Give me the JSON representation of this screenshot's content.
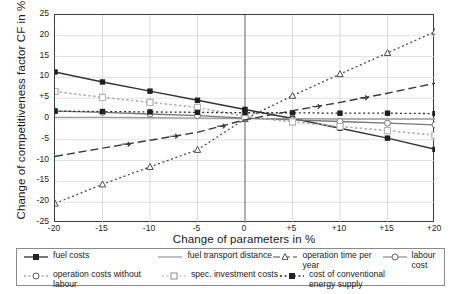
{
  "chart_data": {
    "type": "line",
    "title": "",
    "xlabel": "Change of parameters in %",
    "ylabel": "Change of competitiveness factor CF in %",
    "x": [
      -20,
      -15,
      -10,
      -5,
      0,
      5,
      10,
      15,
      20
    ],
    "xticklabels": [
      "-20",
      "-15",
      "-10",
      "-5",
      "0",
      "+5",
      "+10",
      "+15",
      "+20"
    ],
    "yticklabels": [
      "25",
      "20",
      "15",
      "10",
      "+5",
      "0",
      "-5",
      "-10",
      "-15",
      "-20",
      "-25"
    ],
    "yticks": [
      25,
      20,
      15,
      10,
      5,
      0,
      -5,
      -10,
      -15,
      -20,
      -25
    ],
    "xlim": [
      -20,
      20
    ],
    "ylim": [
      -25,
      25
    ],
    "grid": true,
    "legend_position": "below",
    "series": [
      {
        "name": "fuel costs",
        "color": "#333333",
        "dash": "solid",
        "marker": "filled-square",
        "values": [
          11.3,
          8.9,
          6.7,
          4.5,
          2.3,
          0.1,
          -2.2,
          -4.6,
          -7.3
        ]
      },
      {
        "name": "fuel transport distance",
        "color": "#9a9a9a",
        "dash": "solid",
        "marker": "none",
        "values": [
          0.4,
          0.4,
          0.3,
          0.2,
          0.1,
          0.1,
          0.0,
          0.0,
          0.0
        ]
      },
      {
        "name": "operation time per year",
        "color": "#4a4a4a",
        "dash": "dotted",
        "marker": "open-triangle",
        "values": [
          -20.3,
          -15.7,
          -11.5,
          -7.4,
          0.0,
          5.6,
          10.8,
          15.9,
          21.0
        ]
      },
      {
        "name": "labour cost",
        "color": "#777777",
        "dash": "solid",
        "marker": "open-circle",
        "values": [
          1.9,
          1.6,
          1.2,
          0.8,
          0.2,
          -0.2,
          -0.6,
          -1.0,
          -1.4
        ]
      },
      {
        "name": "operation costs without labour",
        "color": "#9e9e9e",
        "dash": "dashdot",
        "marker": "open-square",
        "values": [
          6.6,
          5.2,
          4.0,
          2.8,
          0.6,
          -0.7,
          -1.8,
          -2.8,
          -3.9
        ]
      },
      {
        "name": "spec. investment costs",
        "color": "#b5b5b5",
        "dash": "dashdot",
        "marker": "open-square",
        "values": [
          6.6,
          5.2,
          4.0,
          2.8,
          0.6,
          -0.7,
          -1.8,
          -2.8,
          -3.9
        ]
      },
      {
        "name": "cost of conventional energy supply",
        "color": "#2e2e2e",
        "dash": "dotted",
        "marker": "filled-square",
        "values": [
          1.9,
          1.8,
          1.7,
          1.6,
          1.5,
          1.5,
          1.4,
          1.4,
          1.3
        ]
      },
      {
        "name": "dashed-line-series",
        "color": "#3a3a3a",
        "dash": "dashed",
        "marker": "none",
        "values": [
          -9.0,
          -7.0,
          -5.1,
          -3.2,
          -0.2,
          2.0,
          4.0,
          6.2,
          8.6
        ]
      }
    ]
  },
  "legend": {
    "items": [
      {
        "label": "fuel costs",
        "key": "solid-filled-square"
      },
      {
        "label": "fuel transport distance",
        "key": "solid-light"
      },
      {
        "label": "operation time per year",
        "key": "dashed-open-triangle"
      },
      {
        "label": "labour cost",
        "key": "solid-open-circle"
      },
      {
        "label": "operation costs without labour",
        "key": "dashdot-open-circle"
      },
      {
        "label": "spec. investment costs",
        "key": "dashdot-open-square"
      },
      {
        "label": "cost of conventional energy supply",
        "key": "dotted-filled-square"
      }
    ]
  }
}
